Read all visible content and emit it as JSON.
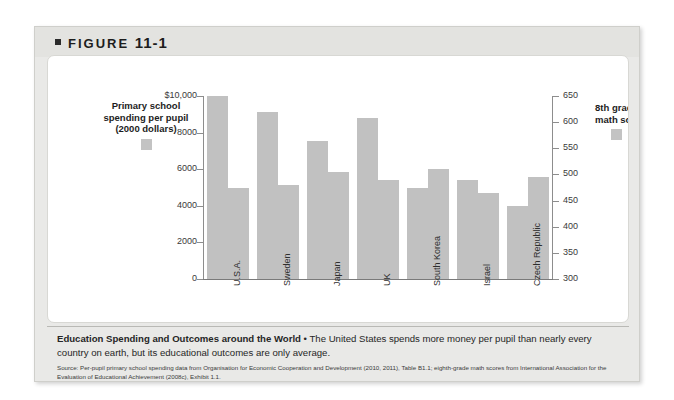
{
  "figure": {
    "label": "FIGURE",
    "number": "11-1",
    "bullet_icon": "square-bullet-icon"
  },
  "legend_left": {
    "title": "Primary school\nspending per pupil\n(2000 dollars)",
    "swatch_color": "#c1c1c1"
  },
  "legend_right": {
    "title": "8th grade\nmath scores",
    "swatch_color": "#c1c1c1"
  },
  "caption": {
    "bold_lead": "Education Spending and Outcomes around the World",
    "separator": " • ",
    "body": "The United States spends more money per pupil than nearly every country on earth, but its educational outcomes are only average."
  },
  "source": {
    "text": "Source: Per-pupil primary school spending data from Organisation for Economic Cooperation and Development (2010, 2011), Table B1.1; eighth-grade math scores from International Association for the Evaluation of Educational Achievement (2008c), Exhibit 1.1."
  },
  "chart_data": {
    "type": "bar",
    "title": "Education Spending and Outcomes around the World",
    "xlabel": "",
    "categories": [
      "U.S.A.",
      "Sweden",
      "Japan",
      "UK",
      "South Korea",
      "Israel",
      "Czech Republic"
    ],
    "series": [
      {
        "name": "Primary school spending per pupil (2000 dollars)",
        "axis": "left",
        "color": "#c1c1c1",
        "values": [
          10000,
          9100,
          7550,
          8800,
          4950,
          5400,
          4000
        ]
      },
      {
        "name": "8th grade math scores",
        "axis": "right",
        "color": "#c1c1c1",
        "values": [
          475,
          480,
          505,
          490,
          510,
          465,
          495
        ]
      }
    ],
    "left_axis": {
      "label": "Primary school spending per pupil (2000 dollars)",
      "ylim": [
        0,
        10000
      ],
      "ticks": [
        0,
        2000,
        4000,
        6000,
        8000,
        10000
      ],
      "tick_labels": [
        "0",
        "2000",
        "4000",
        "6000",
        "8000",
        "$10,000"
      ]
    },
    "right_axis": {
      "label": "8th grade math scores",
      "ylim": [
        300,
        650
      ],
      "ticks": [
        300,
        350,
        400,
        450,
        500,
        550,
        600,
        650
      ],
      "tick_labels": [
        "300",
        "350",
        "400",
        "450",
        "500",
        "550",
        "600",
        "650"
      ]
    },
    "grid": false,
    "legend_position": "outside-left-and-right"
  }
}
